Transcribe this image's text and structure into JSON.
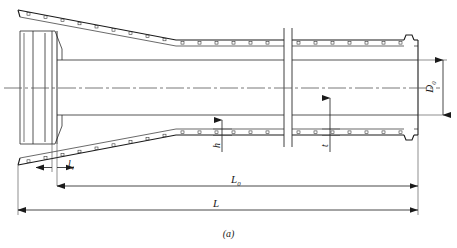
{
  "figure": {
    "caption": "(a)",
    "type": "engineering-drawing"
  },
  "labels": {
    "outer_diameter": {
      "base": "D",
      "sub": "0",
      "full": "D0",
      "orientation": "vertical"
    },
    "socket_length": {
      "base": "l",
      "sub": "4",
      "full": "l4",
      "orientation": "horizontal"
    },
    "barrel_length": {
      "base": "L",
      "sub": "0",
      "full": "L0",
      "orientation": "horizontal"
    },
    "total_length": {
      "base": "L",
      "sub": "",
      "full": "L",
      "orientation": "horizontal"
    },
    "band_height": {
      "base": "h",
      "sub": "",
      "full": "h",
      "orientation": "vertical"
    },
    "wall_thickness": {
      "base": "t",
      "sub": "",
      "full": "t",
      "orientation": "vertical"
    }
  },
  "colors": {
    "line": "#1a1a1a",
    "thin_line": "#444444",
    "center_line": "#555555",
    "background": "#ffffff"
  },
  "geometry": {
    "total_width_px": 457,
    "total_height_px": 248,
    "centerline_y": 88,
    "bell_left_x": 18,
    "barrel_right_x": 418,
    "break_x": [
      284,
      292
    ]
  }
}
